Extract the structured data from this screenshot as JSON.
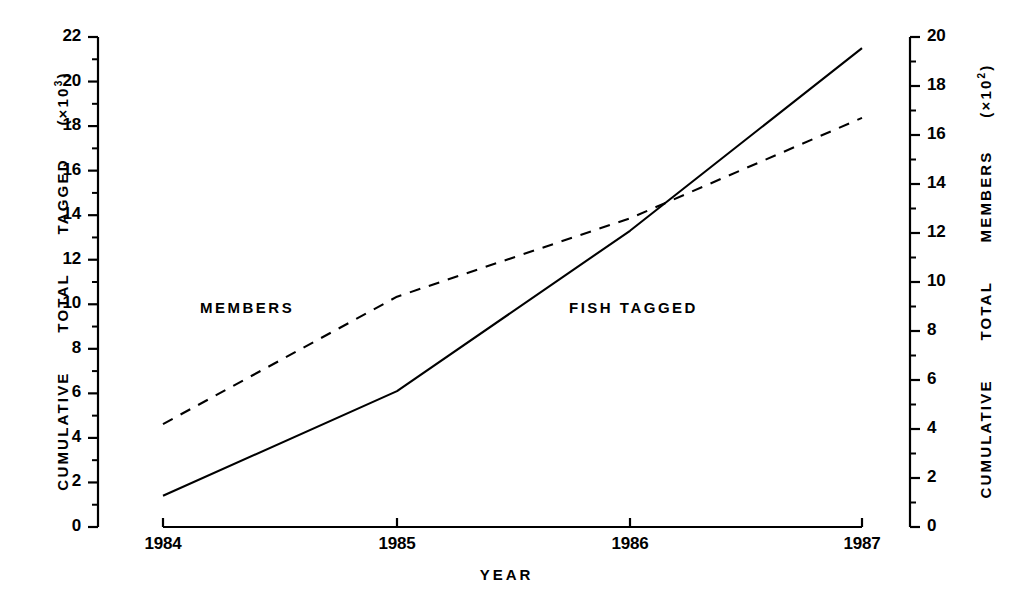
{
  "chart_data": {
    "type": "line",
    "title": "",
    "xlabel": "YEAR",
    "x": [
      1984,
      1985,
      1986,
      1987
    ],
    "xticklabels": [
      "1984",
      "1985",
      "1986",
      "1987"
    ],
    "xlim": [
      1984,
      1987
    ],
    "grid": false,
    "legend": "inline-annotations",
    "axes": [
      {
        "side": "left",
        "label": "CUMULATIVE  TOTAL  TAGGED  (×10³)",
        "label_parts": [
          "CUMULATIVE",
          "TOTAL",
          "TAGGED",
          "(×10",
          "3",
          ")"
        ],
        "ylim": [
          0,
          22
        ],
        "ytick_step": 2,
        "minor_ticks": true,
        "yticklabels": [
          "0",
          "2",
          "4",
          "6",
          "8",
          "10",
          "12",
          "14",
          "16",
          "18",
          "20",
          "22"
        ]
      },
      {
        "side": "right",
        "label": "CUMULATIVE  TOTAL  MEMBERS  (×10²)",
        "label_parts": [
          "CUMULATIVE",
          "TOTAL",
          "MEMBERS",
          "(×10",
          "2",
          ")"
        ],
        "ylim": [
          0,
          20
        ],
        "ytick_step": 2,
        "minor_ticks": true,
        "yticklabels": [
          "0",
          "2",
          "4",
          "6",
          "8",
          "10",
          "12",
          "14",
          "16",
          "18",
          "20"
        ]
      }
    ],
    "series": [
      {
        "name": "FISH  TAGGED",
        "axis": "left",
        "style": "solid",
        "color": "#000000",
        "values": [
          1.4,
          6.1,
          13.3,
          21.5
        ],
        "annotation": {
          "text": "FISH  TAGGED",
          "x": 1986.0,
          "y": 10.0
        }
      },
      {
        "name": "MEMBERS",
        "axis": "right",
        "style": "dashed",
        "color": "#000000",
        "values": [
          4.2,
          9.4,
          12.6,
          16.7
        ],
        "annotation": {
          "text": "MEMBERS",
          "x": 1984.4,
          "y": 9.9
        }
      }
    ]
  },
  "ticks": {
    "left": [
      "22",
      "20",
      "18",
      "16",
      "14",
      "12",
      "10",
      "8",
      "6",
      "4",
      "2",
      "0"
    ],
    "right": [
      "20",
      "18",
      "16",
      "14",
      "12",
      "10",
      "8",
      "6",
      "4",
      "2",
      "0"
    ],
    "x": [
      "1984",
      "1985",
      "1986",
      "1987"
    ]
  },
  "labels": {
    "x_title": "YEAR",
    "left_title_a": "CUMULATIVE",
    "left_title_b": "TOTAL",
    "left_title_c": "TAGGED",
    "left_title_d": "(×10",
    "left_title_sup": "3",
    "left_title_e": ")",
    "right_title_a": "CUMULATIVE",
    "right_title_b": "TOTAL",
    "right_title_c": "MEMBERS",
    "right_title_d": "(×10",
    "right_title_sup": "2",
    "right_title_e": ")",
    "series_members": "MEMBERS",
    "series_fish": "FISH  TAGGED"
  }
}
